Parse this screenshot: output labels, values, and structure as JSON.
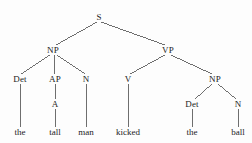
{
  "figure": {
    "type": "syntax-parse-tree",
    "sentence": "the tall man kicked the ball",
    "clipped_caption": "",
    "ink_color": "#4a4a4a",
    "text_color": "#1c1c1c",
    "background_color": "#fdfdfd"
  },
  "nodes": [
    {
      "id": "S",
      "label": "S",
      "x": 99,
      "y": 17
    },
    {
      "id": "NP1",
      "label": "NP",
      "x": 53,
      "y": 50
    },
    {
      "id": "VP",
      "label": "VP",
      "x": 168,
      "y": 50
    },
    {
      "id": "Det1",
      "label": "Det",
      "x": 20,
      "y": 79
    },
    {
      "id": "AP",
      "label": "AP",
      "x": 55,
      "y": 79
    },
    {
      "id": "N1",
      "label": "N",
      "x": 86,
      "y": 79
    },
    {
      "id": "V",
      "label": "V",
      "x": 128,
      "y": 79
    },
    {
      "id": "NP2",
      "label": "NP",
      "x": 215,
      "y": 79
    },
    {
      "id": "A",
      "label": "A",
      "x": 55,
      "y": 104
    },
    {
      "id": "Det2",
      "label": "Det",
      "x": 192,
      "y": 104
    },
    {
      "id": "N2",
      "label": "N",
      "x": 238,
      "y": 104
    }
  ],
  "terminals": [
    {
      "id": "w-the1",
      "label": "the",
      "x": 20,
      "y": 132,
      "parent": "Det1"
    },
    {
      "id": "w-tall",
      "label": "tall",
      "x": 55,
      "y": 132,
      "parent": "A"
    },
    {
      "id": "w-man",
      "label": "man",
      "x": 86,
      "y": 132,
      "parent": "N1"
    },
    {
      "id": "w-kicked",
      "label": "kicked",
      "x": 128,
      "y": 132,
      "parent": "V"
    },
    {
      "id": "w-the2",
      "label": "the",
      "x": 192,
      "y": 132,
      "parent": "Det2"
    },
    {
      "id": "w-ball",
      "label": "ball",
      "x": 238,
      "y": 132,
      "parent": "N2"
    }
  ],
  "edges": [
    {
      "from": "S",
      "to": "NP1",
      "x1": 97,
      "y1": 22,
      "x2": 56,
      "y2": 45
    },
    {
      "from": "S",
      "to": "VP",
      "x1": 101,
      "y1": 22,
      "x2": 165,
      "y2": 45
    },
    {
      "from": "NP1",
      "to": "Det1",
      "x1": 50,
      "y1": 55,
      "x2": 21,
      "y2": 74
    },
    {
      "from": "NP1",
      "to": "AP",
      "x1": 54,
      "y1": 55,
      "x2": 55,
      "y2": 74
    },
    {
      "from": "NP1",
      "to": "N1",
      "x1": 57,
      "y1": 55,
      "x2": 85,
      "y2": 74
    },
    {
      "from": "VP",
      "to": "V",
      "x1": 165,
      "y1": 55,
      "x2": 130,
      "y2": 74
    },
    {
      "from": "VP",
      "to": "NP2",
      "x1": 171,
      "y1": 55,
      "x2": 212,
      "y2": 74
    },
    {
      "from": "AP",
      "to": "A",
      "x1": 55,
      "y1": 84,
      "x2": 55,
      "y2": 99
    },
    {
      "from": "NP2",
      "to": "Det2",
      "x1": 212,
      "y1": 84,
      "x2": 195,
      "y2": 99
    },
    {
      "from": "NP2",
      "to": "N2",
      "x1": 218,
      "y1": 84,
      "x2": 236,
      "y2": 99
    },
    {
      "from": "Det1",
      "to": "w-the1",
      "x1": 20,
      "y1": 84,
      "x2": 20,
      "y2": 127
    },
    {
      "from": "A",
      "to": "w-tall",
      "x1": 55,
      "y1": 109,
      "x2": 55,
      "y2": 127
    },
    {
      "from": "N1",
      "to": "w-man",
      "x1": 86,
      "y1": 84,
      "x2": 86,
      "y2": 127
    },
    {
      "from": "V",
      "to": "w-kicked",
      "x1": 128,
      "y1": 84,
      "x2": 128,
      "y2": 127
    },
    {
      "from": "Det2",
      "to": "w-the2",
      "x1": 192,
      "y1": 109,
      "x2": 192,
      "y2": 127
    },
    {
      "from": "N2",
      "to": "w-ball",
      "x1": 238,
      "y1": 109,
      "x2": 238,
      "y2": 127
    }
  ]
}
